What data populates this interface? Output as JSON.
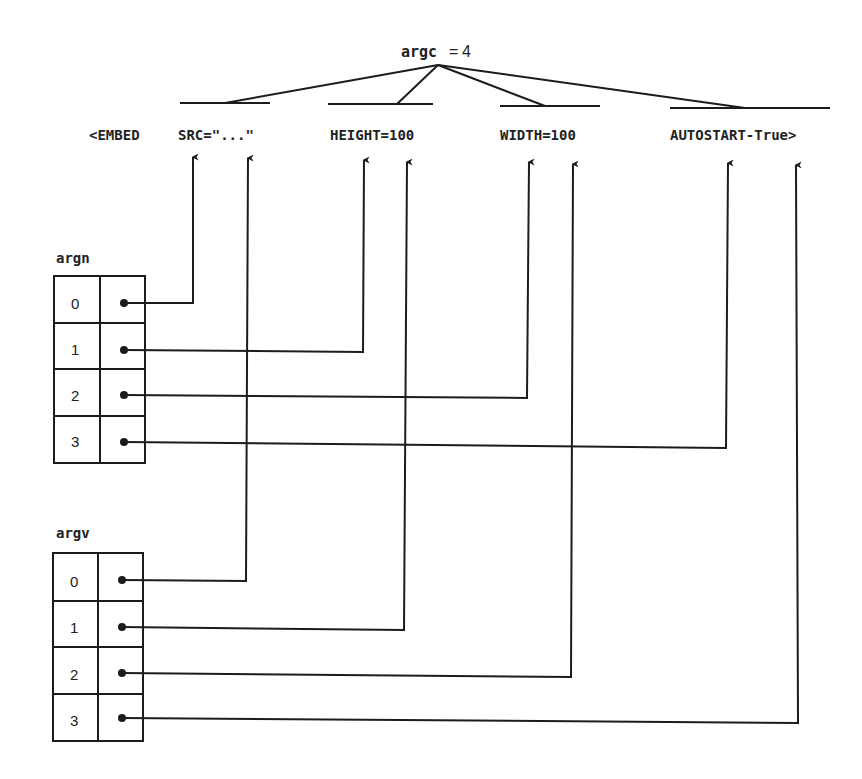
{
  "argc": {
    "label": "argc",
    "equals": "=",
    "value": "4"
  },
  "embed_tag": {
    "open": "<EMBED",
    "attributes": [
      {
        "text": "SRC=\"...\"",
        "name": "SRC",
        "value": "\"...\""
      },
      {
        "text": "HEIGHT=100",
        "name": "HEIGHT",
        "value": "100"
      },
      {
        "text": "WIDTH=100",
        "name": "WIDTH",
        "value": "100"
      },
      {
        "text": "AUTOSTART-True>",
        "name": "AUTOSTART",
        "value": "True"
      }
    ]
  },
  "argn": {
    "title": "argn",
    "indices": [
      "0",
      "1",
      "2",
      "3"
    ]
  },
  "argv": {
    "title": "argv",
    "indices": [
      "0",
      "1",
      "2",
      "3"
    ]
  },
  "colors": {
    "line": "#1c1c1c",
    "background": "#ffffff"
  }
}
